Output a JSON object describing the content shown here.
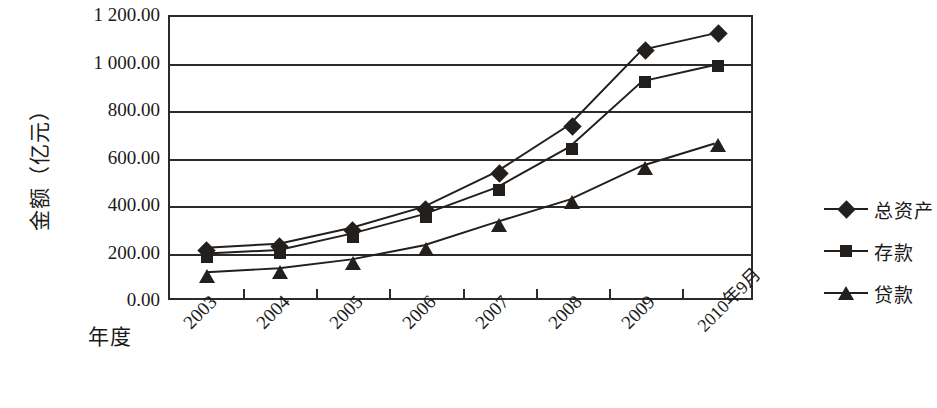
{
  "chart_data": {
    "type": "line",
    "title": "",
    "xlabel": "年度",
    "ylabel": "金额（亿元）",
    "categories": [
      "2003",
      "2004",
      "2005",
      "2006",
      "2007",
      "2008",
      "2009",
      "2010年9月"
    ],
    "ylim": [
      0,
      1200
    ],
    "ytick_labels": [
      "1 200.00",
      "1 000.00",
      "800.00",
      "600.00",
      "400.00",
      "200.00",
      "0.00"
    ],
    "ytick_values": [
      1200,
      1000,
      800,
      600,
      400,
      200,
      0
    ],
    "grid": true,
    "legend_position": "right",
    "series": [
      {
        "name": "总资产",
        "marker": "diamond",
        "color": "#221f1c",
        "values": [
          215,
          232,
          300,
          390,
          540,
          740,
          1060,
          1130
        ]
      },
      {
        "name": "存款",
        "marker": "square",
        "color": "#221f1c",
        "values": [
          190,
          205,
          275,
          358,
          472,
          645,
          925,
          995
        ]
      },
      {
        "name": "贷款",
        "marker": "triangle",
        "color": "#221f1c",
        "values": [
          110,
          127,
          165,
          225,
          325,
          420,
          565,
          660
        ]
      }
    ]
  },
  "axes": {
    "y_title": "金额（亿元）",
    "x_title": "年度"
  },
  "legend": {
    "items": [
      {
        "label": "总资产",
        "marker": "diamond"
      },
      {
        "label": "存款",
        "marker": "square"
      },
      {
        "label": "贷款",
        "marker": "triangle"
      }
    ]
  }
}
